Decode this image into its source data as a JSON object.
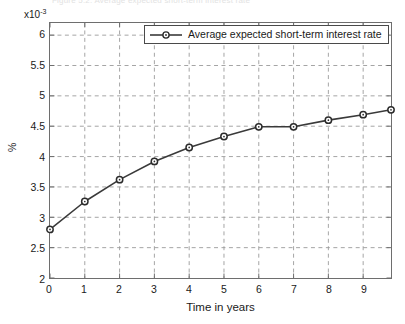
{
  "figure": {
    "caption_remnant": "Figure 5.2: Average expected short-term interest rate"
  },
  "axes": {
    "exponent_prefix": "x10",
    "exponent_power": "-3",
    "ylabel": "%",
    "xlabel": "Time in years",
    "yticks": [
      "2",
      "2.5",
      "3",
      "3.5",
      "4",
      "4.5",
      "5",
      "5.5",
      "6"
    ],
    "xticks": [
      "0",
      "1",
      "2",
      "3",
      "4",
      "5",
      "6",
      "7",
      "8",
      "9"
    ]
  },
  "legend": {
    "entries": [
      {
        "label": "Average expected short-term interest rate",
        "color": "#3a3a3a",
        "marker": "circle-open"
      }
    ]
  },
  "colors": {
    "line": "#3a3a3a",
    "marker_edge": "#2b2b2b",
    "marker_face": "#ffffff",
    "grid": "#9a9a9a",
    "axis": "#6e6e6e",
    "background": "#ffffff"
  },
  "chart_data": {
    "type": "line",
    "title": "",
    "xlabel": "Time in years",
    "ylabel": "%",
    "y_scale_exponent": -3,
    "y_tick_values": [
      2,
      2.5,
      3,
      3.5,
      4,
      4.5,
      5,
      5.5,
      6
    ],
    "x_tick_values": [
      0,
      1,
      2,
      3,
      4,
      5,
      6,
      7,
      8,
      9
    ],
    "xlim": [
      0,
      9.8
    ],
    "ylim": [
      2,
      6.2
    ],
    "grid": true,
    "grid_style": "dashed",
    "legend_position": "top-center",
    "series": [
      {
        "name": "Average expected short-term interest rate",
        "color": "#3a3a3a",
        "marker": "circle-open",
        "x": [
          0,
          1,
          2,
          3,
          4,
          5,
          6,
          7,
          8,
          9,
          9.8
        ],
        "values": [
          2.8,
          3.26,
          3.62,
          3.92,
          4.15,
          4.33,
          4.49,
          4.49,
          4.6,
          4.69,
          4.77
        ]
      }
    ]
  }
}
